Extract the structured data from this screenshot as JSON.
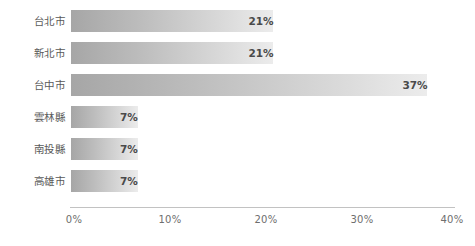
{
  "chart_data": {
    "type": "bar",
    "orientation": "horizontal",
    "title": "",
    "subtitle": "",
    "xlabel": "",
    "ylabel": "",
    "categories": [
      "台北市",
      "新北市",
      "台中市",
      "雲林縣",
      "南投縣",
      "高雄市"
    ],
    "values": [
      21,
      21,
      37,
      7,
      7,
      7
    ],
    "value_labels": [
      "21%",
      "21%",
      "37%",
      "7%",
      "7%",
      "7%"
    ],
    "xlim": [
      0,
      40
    ],
    "x_tick_values": [
      0,
      10,
      20,
      30,
      40
    ],
    "x_tick_labels": [
      "0%",
      "10%",
      "20%",
      "30%",
      "40%"
    ],
    "unit": "%",
    "grid": false,
    "legend": null,
    "series": [
      {
        "name": "",
        "values": [
          21,
          21,
          37,
          7,
          7,
          7
        ]
      }
    ],
    "annotations": [],
    "colors": {
      "bar_gradient_start": "#a6a6a6",
      "bar_gradient_end": "#ececec",
      "value_label": "#4a4a4a",
      "category_label": "#5a5a5a",
      "axis_line": "#c2c2c2",
      "tick_label": "#6e6e6e",
      "background": "#ffffff"
    }
  }
}
